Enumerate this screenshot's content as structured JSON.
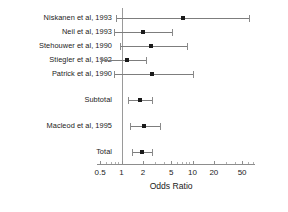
{
  "chart_data": {
    "type": "scatter",
    "title": "",
    "subtitle": "",
    "xlabel": "Odds Ratio",
    "ylabel": "",
    "xscale": "log",
    "xlim": [
      0.45,
      75
    ],
    "grid": false,
    "legend": null,
    "reference_line": 1,
    "tick_labels": [
      "0.5",
      "1",
      "2",
      "5",
      "10",
      "20",
      "50"
    ],
    "tick_values": [
      0.5,
      1,
      2,
      5,
      10,
      20,
      50
    ],
    "categories": [
      "Niskanen et al, 1993",
      "Neil et al, 1993",
      "Stehouwer et al, 1990",
      "Stiegler et al, 1992",
      "Patrick et al, 1990",
      "Subtotal",
      "Macleod et al, 1995",
      "Total"
    ],
    "rows": [
      {
        "label": "Niskanen et al, 1993",
        "or": 7.4,
        "ci_low": 0.85,
        "ci_high": 62.0,
        "gap_before": 0
      },
      {
        "label": "Neil et al, 1993",
        "or": 2.0,
        "ci_low": 0.78,
        "ci_high": 5.2,
        "gap_before": 0
      },
      {
        "label": "Stehouwer et al, 1990",
        "or": 2.6,
        "ci_low": 0.95,
        "ci_high": 8.3,
        "gap_before": 0
      },
      {
        "label": "Stiegler et al, 1992",
        "or": 1.2,
        "ci_low": 0.52,
        "ci_high": 2.2,
        "gap_before": 0
      },
      {
        "label": "Patrick et al, 1990",
        "or": 2.7,
        "ci_low": 0.78,
        "ci_high": 10.2,
        "gap_before": 0
      },
      {
        "label": "Subtotal",
        "or": 1.8,
        "ci_low": 1.25,
        "ci_high": 2.7,
        "gap_before": 1
      },
      {
        "label": "Macleod et al, 1995",
        "or": 2.1,
        "ci_low": 1.32,
        "ci_high": 3.5,
        "gap_before": 1
      },
      {
        "label": "Total",
        "or": 1.95,
        "ci_low": 1.42,
        "ci_high": 2.7,
        "gap_before": 1
      }
    ]
  },
  "colors": {
    "marker": "#1a1a1a",
    "whisker": "#7d7d7d",
    "axis": "#8d8d8d",
    "reference": "#9a9a9a",
    "text": "#1b1b1b",
    "background": "#ffffff"
  }
}
